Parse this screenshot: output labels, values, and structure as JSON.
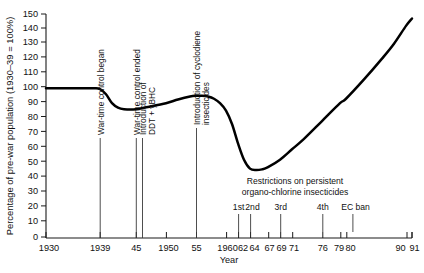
{
  "chart_data": {
    "type": "line",
    "title": "",
    "xlabel": "Year",
    "ylabel": "Percentage of pre-war population (1930–39 = 100%)",
    "xlim": [
      1930,
      1991
    ],
    "ylim": [
      0,
      150
    ],
    "grid": false,
    "legend": "none",
    "y_ticks": [
      0,
      10,
      20,
      30,
      40,
      50,
      60,
      70,
      80,
      90,
      100,
      110,
      120,
      130,
      140,
      150
    ],
    "y_tick_labels": [
      "0",
      "10",
      "20",
      "30",
      "40",
      "50",
      "60",
      "70",
      "80",
      "90",
      "100",
      "110",
      "120",
      "130",
      "140",
      "150"
    ],
    "x_ticks": [
      1930,
      1939,
      1945,
      1950,
      1955,
      1960,
      1962,
      1964,
      1967,
      1969,
      1971,
      1976,
      1979,
      1980,
      1990,
      1991
    ],
    "x_tick_labels": [
      "1930",
      "1939",
      "45",
      "1950",
      "55",
      "1960",
      "62",
      "64",
      "67",
      "69",
      "71",
      "76",
      "79",
      "80",
      "90",
      "91"
    ],
    "series": [
      {
        "name": "Percentage of pre-war population",
        "x": [
          1930,
          1933,
          1936,
          1938,
          1939,
          1940,
          1941,
          1942,
          1943,
          1945,
          1947,
          1950,
          1952,
          1954,
          1955,
          1956,
          1957,
          1958,
          1959,
          1960,
          1961,
          1962,
          1963,
          1964,
          1965,
          1966,
          1967,
          1969,
          1971,
          1973,
          1976,
          1979,
          1980,
          1983,
          1986,
          1988,
          1990,
          1991
        ],
        "values": [
          100,
          100,
          100,
          100,
          99.5,
          96,
          90,
          87,
          86,
          86,
          87.5,
          90,
          92.5,
          94.5,
          95,
          95,
          94.5,
          93,
          90,
          85,
          76,
          63,
          52,
          46,
          45,
          45.5,
          47,
          52,
          59,
          66,
          78,
          90,
          93,
          106,
          120,
          130,
          142,
          147
        ]
      }
    ],
    "annotations": [
      {
        "label": "War-time control began",
        "year": 1939,
        "orientation": "vertical"
      },
      {
        "label": "War-time control ended",
        "year": 1945,
        "orientation": "vertical"
      },
      {
        "label": "Introduction of\nDDT + γBHC",
        "year": 1946,
        "orientation": "vertical"
      },
      {
        "label": "Introduction of cyclodiene\ninsecticides",
        "year": 1955,
        "orientation": "vertical"
      },
      {
        "label": "Restrictions on persistent\norgano-chlorine insecticides",
        "year": 1970,
        "orientation": "horizontal"
      }
    ],
    "restriction_markers": [
      {
        "label": "1st",
        "year": 1962
      },
      {
        "label": "2nd",
        "year": 1964
      },
      {
        "label": "3rd",
        "year": 1969
      },
      {
        "label": "4th",
        "year": 1976
      },
      {
        "label": "EC ban",
        "year": 1981
      }
    ]
  },
  "annotation_text": {
    "war_began": "War-time control began",
    "war_ended": "War-time control ended",
    "ddt_line1": "Introduction of",
    "ddt_line2": "DDT + γBHC",
    "cyclodiene_line1": "Introduction of cyclodiene",
    "cyclodiene_line2": "insecticides",
    "restrictions_line1": "Restrictions on persistent",
    "restrictions_line2": "organo-chlorine insecticides",
    "ord_1st": "1st",
    "ord_2nd": "2nd",
    "ord_3rd": "3rd",
    "ord_4th": "4th",
    "ord_ec": "EC ban"
  },
  "axes": {
    "x_title": "Year",
    "y_title": "Percentage of pre-war population (1930–39 = 100%)",
    "y_0": "0",
    "y_10": "10",
    "y_20": "20",
    "y_30": "30",
    "y_40": "40",
    "y_50": "50",
    "y_60": "60",
    "y_70": "70",
    "y_80": "80",
    "y_90": "90",
    "y_100": "100",
    "y_110": "110",
    "y_120": "120",
    "y_130": "130",
    "y_140": "140",
    "y_150": "150",
    "x_1930": "1930",
    "x_1939": "1939",
    "x_45": "45",
    "x_1950": "1950",
    "x_55": "55",
    "x_1960": "1960",
    "x_62": "62",
    "x_64": "64",
    "x_67": "67",
    "x_69": "69",
    "x_71": "71",
    "x_76": "76",
    "x_79": "79",
    "x_80": "80",
    "x_90": "90",
    "x_91": "91"
  },
  "colors": {
    "line": "#000000",
    "axis": "#1a1a1a",
    "text": "#111111",
    "background": "#ffffff"
  }
}
